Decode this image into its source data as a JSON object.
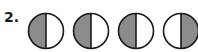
{
  "problem": {
    "number_label": "2."
  },
  "colors": {
    "shade": "#8c8c8c",
    "outline": "#1a1a1a",
    "unshaded": "#ffffff"
  },
  "figures": [
    {
      "id": 1,
      "divided_into": 2,
      "division": "vertical",
      "shaded_half": "left"
    },
    {
      "id": 2,
      "divided_into": 2,
      "division": "vertical",
      "shaded_half": "left"
    },
    {
      "id": 3,
      "divided_into": 2,
      "division": "vertical",
      "shaded_half": "left"
    },
    {
      "id": 4,
      "divided_into": 2,
      "division": "vertical",
      "shaded_half": "right"
    }
  ]
}
